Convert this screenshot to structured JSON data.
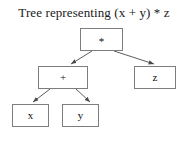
{
  "figure": {
    "title": "Tree representing (x + y) * z",
    "background_color": "#ffffff",
    "border_color": "#7d7d7d",
    "text_color": "#111111"
  },
  "tree": {
    "nodes": [
      {
        "id": "root",
        "label": "*",
        "x": 80,
        "y": 28,
        "width": 43,
        "height": 23
      },
      {
        "id": "plus",
        "label": "+",
        "x": 38,
        "y": 66,
        "width": 50,
        "height": 23
      },
      {
        "id": "z",
        "label": "z",
        "x": 134,
        "y": 66,
        "width": 42,
        "height": 23
      },
      {
        "id": "x",
        "label": "x",
        "x": 12,
        "y": 104,
        "width": 37,
        "height": 23
      },
      {
        "id": "y",
        "label": "y",
        "x": 62,
        "y": 104,
        "width": 37,
        "height": 23
      }
    ],
    "edges": [
      {
        "from": "root",
        "to": "plus"
      },
      {
        "from": "root",
        "to": "z"
      },
      {
        "from": "plus",
        "to": "x"
      },
      {
        "from": "plus",
        "to": "y"
      }
    ]
  }
}
